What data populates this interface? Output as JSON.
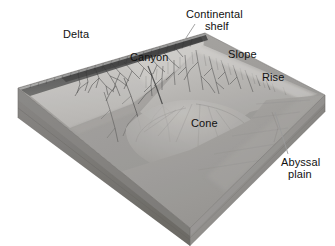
{
  "figure": {
    "type": "geological-block-diagram",
    "style": "grayscale halftone photograph of a physiographic model",
    "canvas": {
      "width": 335,
      "height": 246
    }
  },
  "labels": [
    {
      "id": "delta",
      "text": "Delta",
      "x": 63,
      "y": 29,
      "leader": false
    },
    {
      "id": "continental-shelf",
      "text": "Continental",
      "x": 186,
      "y": 9,
      "leader": true
    },
    {
      "id": "continental-shelf-line2",
      "text": "shelf",
      "x": 205,
      "y": 21,
      "leader": false
    },
    {
      "id": "canyon",
      "text": "Canyon",
      "x": 130,
      "y": 52,
      "leader": false
    },
    {
      "id": "slope",
      "text": "Slope",
      "x": 228,
      "y": 49,
      "leader": false
    },
    {
      "id": "rise",
      "text": "Rise",
      "x": 262,
      "y": 72,
      "leader": false
    },
    {
      "id": "cone",
      "text": "Cone",
      "x": 191,
      "y": 118,
      "leader": false
    },
    {
      "id": "abyssal-plain",
      "text": "Abyssal",
      "x": 281,
      "y": 157,
      "leader": true
    },
    {
      "id": "abyssal-plain-line2",
      "text": "plain",
      "x": 288,
      "y": 169,
      "leader": false
    }
  ],
  "leaders": [
    {
      "id": "leader-continental-shelf",
      "x1": 195,
      "y1": 24,
      "x2": 184,
      "y2": 41
    },
    {
      "id": "leader-abyssal-plain",
      "x1": 288,
      "y1": 154,
      "x2": 275,
      "y2": 112
    }
  ],
  "features": {
    "delta": "branching distributary channels at the shoreline",
    "shelf": "flat light-toned platform behind the shelf break",
    "canyon": "dendritic submarine canyons incised into the slope",
    "slope": "steep dissected face descending from the shelf break",
    "rise": "gently sloping apron at the base of the slope",
    "cone": "deep-sea fan spreading from the canyon mouth",
    "abyssal_plain": "flat deep ocean floor in the foreground"
  },
  "colors": {
    "background": "#ffffff",
    "label_text": "#111111",
    "leader_line": "#9a9a9a",
    "shelf_top": "#d4d2cf",
    "shelf_top_shadow": "#bbb9b6",
    "shoreline_dark": "#4a4a4a",
    "slope_light": "#cfcdca",
    "slope_mid": "#b4b2af",
    "abyssal_floor": "#a9a7a4",
    "abyssal_floor_dark": "#9a9895",
    "left_face": "#8b8986",
    "left_face_dark": "#777572",
    "front_face": "#a3a19e",
    "front_face_dark": "#8e8c89",
    "right_face": "#9d9b98",
    "basal_band": "#7e7c79",
    "edge_line": "#6e6c69"
  },
  "geometry": {
    "block_back_apex": [
      205,
      33
    ],
    "block_left_corner": [
      18,
      88
    ],
    "block_right_corner": [
      325,
      95
    ],
    "block_front_corner": [
      190,
      228
    ],
    "slab_thickness_px": 30
  }
}
